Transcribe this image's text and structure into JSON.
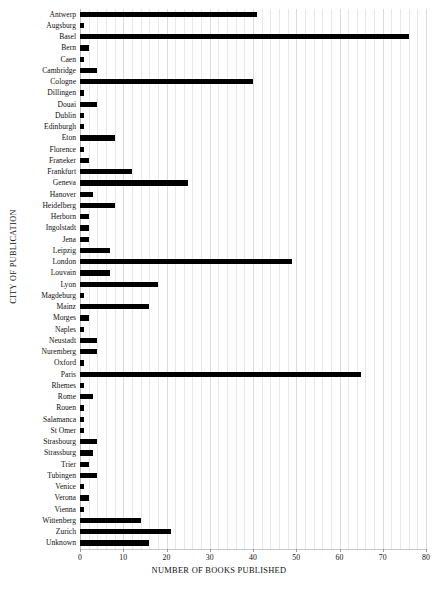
{
  "chart_data": {
    "type": "bar",
    "orientation": "horizontal",
    "title": "",
    "xlabel": "NUMBER OF BOOKS PUBLISHED",
    "ylabel": "CITY OF PUBLICATION",
    "xlim": [
      0,
      80
    ],
    "xticks": [
      0,
      10,
      20,
      30,
      40,
      50,
      60,
      70,
      80
    ],
    "grid": true,
    "grid_axis": "x",
    "minor_grid_step": 2,
    "legend": null,
    "bar_color": "#000000",
    "categories": [
      "Antwerp",
      "Augsburg",
      "Basel",
      "Bern",
      "Caen",
      "Cambridge",
      "Cologne",
      "Dillingen",
      "Douai",
      "Dublin",
      "Edinburgh",
      "Eton",
      "Florence",
      "Franeker",
      "Frankfurt",
      "Geneva",
      "Hanover",
      "Heidelberg",
      "Herborn",
      "Ingolstadt",
      "Jena",
      "Leipzig",
      "London",
      "Louvain",
      "Lyon",
      "Magdeburg",
      "Mainz",
      "Morges",
      "Naples",
      "Neustadt",
      "Nuremberg",
      "Oxford",
      "Paris",
      "Rhemes",
      "Rome",
      "Rouen",
      "Salamanca",
      "St Omer",
      "Strasbourg",
      "Strassburg",
      "Trier",
      "Tubingen",
      "Venice",
      "Verona",
      "Vienna",
      "Wittenberg",
      "Zurich",
      "Unknown"
    ],
    "values": [
      41,
      1,
      76,
      2,
      1,
      4,
      40,
      1,
      4,
      1,
      1,
      8,
      1,
      2,
      12,
      25,
      3,
      8,
      2,
      2,
      2,
      7,
      49,
      7,
      18,
      1,
      16,
      2,
      1,
      4,
      4,
      1,
      65,
      1,
      3,
      1,
      1,
      1,
      4,
      3,
      2,
      4,
      1,
      2,
      1,
      14,
      21,
      16
    ]
  },
  "caption": ""
}
